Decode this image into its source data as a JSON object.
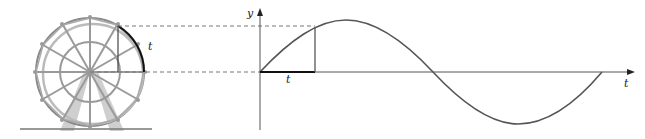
{
  "figure": {
    "labels": {
      "wheel_arc": "t",
      "y_axis": "y",
      "x_axis": "t",
      "base_segment": "t"
    },
    "colors": {
      "curve": "#555555",
      "axis": "#555555",
      "wheel": "#9a9a9a",
      "highlight": "#111111",
      "dashed": "#777777"
    }
  }
}
